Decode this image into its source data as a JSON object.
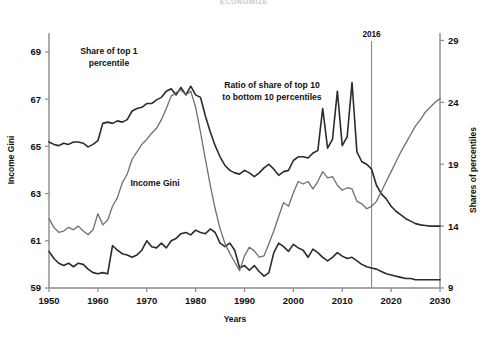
{
  "figure": {
    "top_title_faint": "ECONOMIZE",
    "width": 488,
    "height": 340
  },
  "axes": {
    "x": {
      "label": "Years",
      "ticks": [
        "1950",
        "1960",
        "1970",
        "1980",
        "1990",
        "2000",
        "2010",
        "2020",
        "2030"
      ],
      "min": 1950,
      "max": 2030
    },
    "y_left": {
      "label": "Income Gini",
      "ticks": [
        "59",
        "61",
        "63",
        "65",
        "67",
        "69"
      ],
      "min": 59,
      "max": 69.8
    },
    "y_right": {
      "label": "Shares of percentiles",
      "ticks": [
        "9",
        "14",
        "19",
        "24",
        "29"
      ],
      "min": 9,
      "max": 29.6
    }
  },
  "annotations": {
    "top1": "Share of top 1\npercentile",
    "top1_line1": "Share of top 1",
    "top1_line2": "percentile",
    "ratio_line1": "Ratio of share of top 10",
    "ratio_line2": "to bottom 10 percentiles",
    "gini": "Income Gini",
    "marker_2016": "2016"
  },
  "colors": {
    "axis": "#8a8a8e",
    "series_dark": "#2b2b2b",
    "series_gray": "#6f6f72",
    "background": "#ffffff",
    "marker_line": "#8a8a8e",
    "text": "#111111"
  },
  "chart_data": {
    "type": "line",
    "title": "",
    "xlabel": "Years",
    "ylabel": "Income Gini",
    "ylabel_right": "Shares of percentiles",
    "xlim": [
      1950,
      2030
    ],
    "ylim": [
      59,
      69.8
    ],
    "ylim_right": [
      9,
      29.6
    ],
    "grid": false,
    "legend": "inline-annotations",
    "forecast_marker_year": 2016,
    "series": [
      {
        "name": "Income Gini",
        "axis": "left",
        "color": "#2b2b2b",
        "unit": "Gini index",
        "x": [
          1950,
          1951,
          1952,
          1953,
          1954,
          1955,
          1956,
          1957,
          1958,
          1959,
          1960,
          1961,
          1962,
          1963,
          1964,
          1965,
          1966,
          1967,
          1968,
          1969,
          1970,
          1971,
          1972,
          1973,
          1974,
          1975,
          1976,
          1977,
          1978,
          1979,
          1980,
          1981,
          1982,
          1983,
          1984,
          1985,
          1986,
          1987,
          1988,
          1989,
          1990,
          1991,
          1992,
          1993,
          1994,
          1995,
          1996,
          1997,
          1998,
          1999,
          2000,
          2001,
          2002,
          2003,
          2004,
          2005,
          2006,
          2007,
          2008,
          2009,
          2010,
          2011,
          2012,
          2013,
          2014,
          2015,
          2016,
          2017,
          2018,
          2019,
          2020,
          2021,
          2022,
          2023,
          2024,
          2025,
          2026,
          2027,
          2028,
          2029,
          2030
        ],
        "y": [
          60.55,
          60.25,
          60.05,
          59.95,
          60.05,
          59.9,
          60.05,
          60.0,
          59.8,
          59.65,
          59.6,
          59.65,
          59.6,
          60.8,
          60.6,
          60.45,
          60.4,
          60.3,
          60.4,
          60.6,
          61.0,
          60.75,
          60.7,
          60.9,
          60.7,
          61.0,
          61.1,
          61.3,
          61.35,
          61.25,
          61.45,
          61.35,
          61.3,
          61.5,
          61.35,
          60.9,
          60.75,
          60.9,
          60.6,
          59.85,
          59.95,
          59.75,
          59.95,
          59.7,
          59.5,
          59.65,
          60.5,
          60.9,
          60.75,
          60.55,
          60.85,
          60.7,
          60.6,
          60.3,
          60.65,
          60.5,
          60.3,
          60.15,
          60.3,
          60.5,
          60.35,
          60.25,
          60.3,
          60.15,
          60.0,
          59.9,
          59.85,
          59.8,
          59.7,
          59.6,
          59.55,
          59.5,
          59.45,
          59.4,
          59.4,
          59.35,
          59.35,
          59.35,
          59.35,
          59.35,
          59.35
        ]
      },
      {
        "name": "Share of top 1 percentile",
        "axis": "right",
        "color": "#2b2b2b",
        "unit": "percent share",
        "x": [
          1950,
          1951,
          1952,
          1953,
          1954,
          1955,
          1956,
          1957,
          1958,
          1959,
          1960,
          1961,
          1962,
          1963,
          1964,
          1965,
          1966,
          1967,
          1968,
          1969,
          1970,
          1971,
          1972,
          1973,
          1974,
          1975,
          1976,
          1977,
          1978,
          1979,
          1980,
          1981,
          1982,
          1983,
          1984,
          1985,
          1986,
          1987,
          1988,
          1989,
          1990,
          1991,
          1992,
          1993,
          1994,
          1995,
          1996,
          1997,
          1998,
          1999,
          2000,
          2001,
          2002,
          2003,
          2004,
          2005,
          2006,
          2007,
          2008,
          2009,
          2010,
          2011,
          2012,
          2013,
          2014,
          2015,
          2016,
          2017,
          2018,
          2019,
          2020,
          2021,
          2022,
          2023,
          2024,
          2025,
          2026,
          2027,
          2028,
          2029,
          2030
        ],
        "y": [
          20.8,
          20.6,
          20.5,
          20.7,
          20.6,
          20.8,
          20.8,
          20.7,
          20.4,
          20.6,
          20.9,
          22.3,
          22.4,
          22.3,
          22.5,
          22.4,
          22.6,
          23.3,
          23.5,
          23.6,
          23.9,
          23.9,
          24.2,
          24.4,
          24.9,
          25.1,
          24.6,
          25.2,
          24.6,
          25.3,
          24.6,
          24.4,
          22.9,
          21.6,
          20.5,
          19.6,
          18.9,
          18.5,
          18.3,
          18.2,
          18.5,
          18.3,
          18.0,
          18.3,
          18.7,
          19.0,
          18.6,
          18.1,
          18.4,
          18.5,
          19.3,
          19.6,
          19.6,
          19.5,
          19.9,
          20.1,
          23.5,
          20.3,
          21.0,
          24.9,
          20.5,
          21.2,
          25.6,
          20.0,
          19.2,
          19.0,
          18.6,
          17.3,
          16.6,
          16.2,
          15.6,
          15.2,
          14.9,
          14.6,
          14.4,
          14.2,
          14.1,
          14.05,
          14.0,
          14.0,
          14.0
        ]
      },
      {
        "name": "Ratio of share of top 10 to bottom 10 percentiles",
        "axis": "right",
        "color": "#6f6f72",
        "unit": "ratio",
        "x": [
          1950,
          1951,
          1952,
          1953,
          1954,
          1955,
          1956,
          1957,
          1958,
          1959,
          1960,
          1961,
          1962,
          1963,
          1964,
          1965,
          1966,
          1967,
          1968,
          1969,
          1970,
          1971,
          1972,
          1973,
          1974,
          1975,
          1976,
          1977,
          1978,
          1979,
          1980,
          1981,
          1982,
          1983,
          1984,
          1985,
          1986,
          1987,
          1988,
          1989,
          1990,
          1991,
          1992,
          1993,
          1994,
          1995,
          1996,
          1997,
          1998,
          1999,
          2000,
          2001,
          2002,
          2003,
          2004,
          2005,
          2006,
          2007,
          2008,
          2009,
          2010,
          2011,
          2012,
          2013,
          2014,
          2015,
          2016,
          2017,
          2018,
          2019,
          2020,
          2021,
          2022,
          2023,
          2024,
          2025,
          2026,
          2027,
          2028,
          2029,
          2030
        ],
        "y": [
          14.6,
          13.9,
          13.5,
          13.6,
          13.9,
          13.7,
          14.0,
          13.6,
          13.3,
          13.7,
          15.0,
          14.1,
          14.5,
          15.6,
          16.3,
          17.5,
          18.2,
          19.4,
          20.0,
          20.6,
          21.0,
          21.5,
          21.9,
          22.6,
          23.5,
          24.5,
          24.8,
          25.0,
          24.6,
          24.9,
          23.6,
          21.6,
          19.4,
          17.3,
          15.4,
          13.8,
          12.6,
          11.8,
          11.1,
          10.4,
          11.6,
          12.3,
          12.0,
          11.5,
          11.6,
          12.6,
          13.6,
          14.8,
          15.9,
          15.6,
          16.7,
          17.6,
          17.4,
          17.6,
          17.0,
          17.6,
          18.4,
          17.9,
          18.0,
          17.3,
          16.9,
          17.1,
          17.0,
          16.0,
          15.8,
          15.4,
          15.6,
          16.0,
          16.8,
          17.6,
          18.4,
          19.2,
          20.0,
          20.7,
          21.4,
          22.1,
          22.6,
          23.2,
          23.6,
          24.0,
          24.3
        ]
      }
    ]
  }
}
